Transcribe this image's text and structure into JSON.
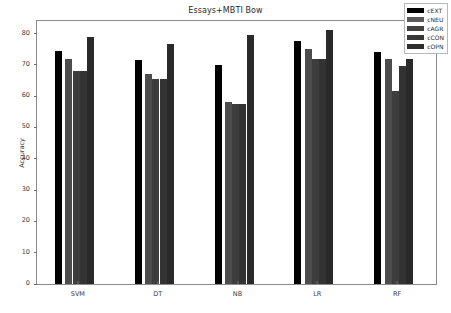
{
  "chart_data": {
    "type": "bar",
    "title": "Essays+MBTI Bow",
    "xlabel": "",
    "ylabel": "Accuracy",
    "categories": [
      "SVM",
      "DT",
      "NB",
      "LR",
      "RF"
    ],
    "yticks": [
      0,
      10,
      20,
      30,
      40,
      50,
      60,
      70,
      80
    ],
    "ylim": [
      0,
      84
    ],
    "grid": false,
    "legend_position": "upper right",
    "series": [
      {
        "name": "cEXT",
        "color": "#000000",
        "values": [
          74.5,
          71.5,
          70.0,
          77.5,
          74.0
        ]
      },
      {
        "name": "cNEU",
        "color": "#4d4d4d",
        "values": [
          72.0,
          67.0,
          58.0,
          75.0,
          72.0
        ]
      },
      {
        "name": "cAGR",
        "color": "#3d3d3d",
        "values": [
          68.0,
          65.5,
          57.5,
          72.0,
          61.5
        ]
      },
      {
        "name": "cCON",
        "color": "#333333",
        "values": [
          68.0,
          65.5,
          57.5,
          72.0,
          69.5
        ]
      },
      {
        "name": "cOPN",
        "color": "#2a2a2a",
        "values": [
          79.0,
          76.5,
          79.5,
          81.0,
          72.0
        ]
      }
    ]
  },
  "axes": {
    "y_label": "Accuracy"
  },
  "legend": {
    "entries": [
      {
        "label": "cEXT",
        "color": "#000000"
      },
      {
        "label": "cNEU",
        "color": "#5a5a5a"
      },
      {
        "label": "cAGR",
        "color": "#424242"
      },
      {
        "label": "cCON",
        "color": "#383838"
      },
      {
        "label": "cOPN",
        "color": "#2e2e2e"
      }
    ]
  }
}
